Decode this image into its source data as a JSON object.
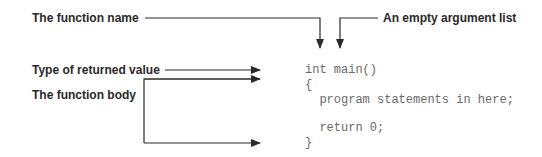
{
  "labels": {
    "function_name": "The function name",
    "empty_arg_list": "An empty argument list",
    "return_type": "Type of returned value",
    "function_body": "The function body"
  },
  "code": {
    "lines": [
      "int main()",
      "{",
      "  program statements in here;",
      "",
      "  return 0;",
      "}"
    ]
  },
  "colors": {
    "label_text": "#2a2a2a",
    "code_text": "#6a6a6a",
    "arrow": "#2a2a2a"
  }
}
